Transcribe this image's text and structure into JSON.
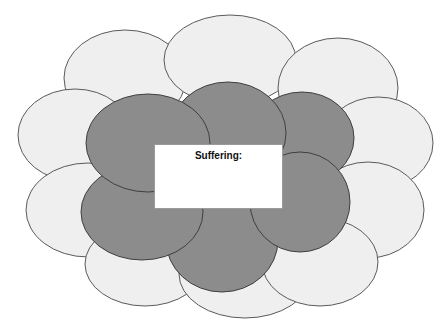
{
  "diagram": {
    "type": "cloud-cluster",
    "center_box": {
      "title": "Suffering:",
      "body": ""
    },
    "colors": {
      "outer_fill": "#efefef",
      "inner_fill": "#8c8c8c",
      "outline": "#4a4a4a",
      "background": "#ffffff"
    },
    "outer_ellipses": [
      {
        "id": "outer-top-left",
        "cx": 125,
        "cy": 78,
        "rx": 61,
        "ry": 48
      },
      {
        "id": "outer-top-center",
        "cx": 230,
        "cy": 60,
        "rx": 66,
        "ry": 45
      },
      {
        "id": "outer-top-right",
        "cx": 338,
        "cy": 88,
        "rx": 60,
        "ry": 50
      },
      {
        "id": "outer-left-upper",
        "cx": 75,
        "cy": 135,
        "rx": 57,
        "ry": 46
      },
      {
        "id": "outer-right-upper",
        "cx": 378,
        "cy": 143,
        "rx": 55,
        "ry": 46
      },
      {
        "id": "outer-left-lower",
        "cx": 88,
        "cy": 210,
        "rx": 62,
        "ry": 47
      },
      {
        "id": "outer-right-lower",
        "cx": 368,
        "cy": 210,
        "rx": 56,
        "ry": 48
      },
      {
        "id": "outer-bottom-left",
        "cx": 145,
        "cy": 264,
        "rx": 60,
        "ry": 42
      },
      {
        "id": "outer-bottom-center",
        "cx": 245,
        "cy": 274,
        "rx": 66,
        "ry": 44
      },
      {
        "id": "outer-bottom-right",
        "cx": 320,
        "cy": 262,
        "rx": 58,
        "ry": 44
      }
    ],
    "inner_ellipses": [
      {
        "id": "inner-bottom-center",
        "cx": 222,
        "cy": 240,
        "rx": 56,
        "ry": 52
      },
      {
        "id": "inner-bottom-left",
        "cx": 142,
        "cy": 212,
        "rx": 61,
        "ry": 48
      },
      {
        "id": "inner-top-right",
        "cx": 302,
        "cy": 138,
        "rx": 52,
        "ry": 46
      },
      {
        "id": "inner-bottom-right",
        "cx": 300,
        "cy": 202,
        "rx": 50,
        "ry": 50
      },
      {
        "id": "inner-top-center",
        "cx": 228,
        "cy": 133,
        "rx": 58,
        "ry": 51
      },
      {
        "id": "inner-top-left",
        "cx": 148,
        "cy": 143,
        "rx": 62,
        "ry": 49
      }
    ]
  }
}
